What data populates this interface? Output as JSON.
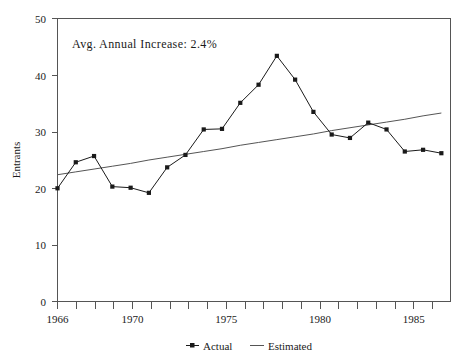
{
  "chart_data": {
    "type": "line",
    "title": "",
    "xlabel": "",
    "ylabel": "Entrants",
    "xlim": [
      1966,
      1987.5
    ],
    "ylim": [
      0,
      50
    ],
    "grid": false,
    "legend_position": "bottom-center",
    "annotation": "Avg. Annual Increase: 2.4%",
    "x": [
      1966,
      1967,
      1968,
      1969,
      1970,
      1971,
      1972,
      1973,
      1974,
      1975,
      1976,
      1977,
      1978,
      1979,
      1980,
      1981,
      1982,
      1983,
      1984,
      1985,
      1986,
      1987
    ],
    "xtick_labels": [
      "1966",
      "1970",
      "1975",
      "1980",
      "1985"
    ],
    "xticks": [
      1966,
      1970,
      1975,
      1980,
      1985
    ],
    "ytick_labels": [
      "0",
      "10",
      "20",
      "30",
      "40",
      "50"
    ],
    "yticks": [
      0,
      10,
      20,
      30,
      40,
      50
    ],
    "series": [
      {
        "name": "Actual",
        "marker": "square",
        "values": [
          20.0,
          24.6,
          25.7,
          20.3,
          20.1,
          19.2,
          23.7,
          25.9,
          30.4,
          30.5,
          35.1,
          38.3,
          43.4,
          39.2,
          33.5,
          29.5,
          28.9,
          31.6,
          30.4,
          26.5,
          26.8,
          26.2
        ]
      },
      {
        "name": "Estimated",
        "marker": "none",
        "values": [
          22.4,
          22.9,
          23.4,
          23.9,
          24.4,
          25.0,
          25.5,
          26.0,
          26.5,
          27.0,
          27.6,
          28.1,
          28.6,
          29.1,
          29.6,
          30.2,
          30.7,
          31.2,
          31.7,
          32.2,
          32.8,
          33.3
        ]
      }
    ]
  },
  "legend": {
    "items": [
      {
        "label": "Actual"
      },
      {
        "label": "Estimated"
      }
    ]
  },
  "colors": {
    "actual": "#1a1a1a",
    "estimated": "#555555",
    "axis": "#555555",
    "background": "#ffffff"
  }
}
